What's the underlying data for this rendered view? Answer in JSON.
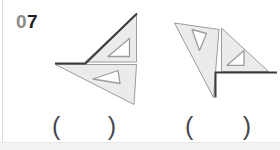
{
  "page": {
    "background": "#ffffff",
    "left_rule_color": "#d9d9d9",
    "bottom_strip_color": "#f3f3f3"
  },
  "question": {
    "number_dim": "0",
    "number_bold": "7",
    "dim_color": "#8c8c8c",
    "bold_color": "#1f1f1f"
  },
  "answers": [
    {
      "open": "(",
      "close": ")"
    },
    {
      "open": "(",
      "close": ")"
    }
  ],
  "figures": {
    "fill": "#ebebeb",
    "stroke": "#9c9c9c",
    "hole_fill": "#ffffff",
    "accent": "#3b3b3b",
    "shapes": [
      {
        "name": "left-figure-upper-set-square",
        "type": "polygon",
        "kind": "body",
        "points": "85,62 136.5,62 136.5,13.5"
      },
      {
        "name": "left-figure-upper-hole",
        "type": "polygon",
        "kind": "hole",
        "points": "108,56.5 129.5,56.5 129.5,38.5"
      },
      {
        "name": "left-figure-lower-set-square",
        "type": "polygon",
        "kind": "body",
        "points": "55.5,64.5 136.5,64.5 134,104.5"
      },
      {
        "name": "left-figure-lower-hole",
        "type": "polygon",
        "kind": "hole",
        "points": "93,79 118,70.5 120,83.5"
      },
      {
        "name": "left-figure-traced-line",
        "type": "polyline",
        "kind": "accent",
        "points": "55,63.4 85.5,63.4 137,13.5"
      },
      {
        "name": "right-figure-left-set-square",
        "type": "polygon",
        "kind": "body",
        "points": "174.5,23 219,29.5 213.5,97.5"
      },
      {
        "name": "right-figure-left-hole",
        "type": "polygon",
        "kind": "hole",
        "points": "192,29.5 206.5,33.5 199.5,50.5"
      },
      {
        "name": "right-figure-right-set-square",
        "type": "polygon",
        "kind": "body",
        "points": "221.5,28 268.5,71.5 221.5,71.5"
      },
      {
        "name": "right-figure-right-hole",
        "type": "polygon",
        "kind": "hole",
        "points": "227,65.3 244,65.3 244,50.5"
      },
      {
        "name": "right-figure-traced-line",
        "type": "polyline",
        "kind": "accent",
        "points": "215.5,97.5 215.5,72.5 277,72.5"
      }
    ]
  }
}
